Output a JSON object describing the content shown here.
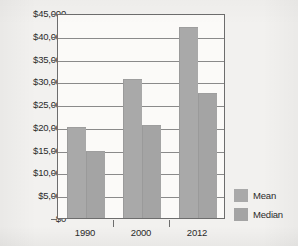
{
  "chart_data": {
    "type": "bar",
    "title": "",
    "xlabel": "",
    "ylabel": "",
    "categories": [
      "1990",
      "2000",
      "2012"
    ],
    "series": [
      {
        "name": "Mean",
        "values": [
          19900,
          30500,
          42000
        ]
      },
      {
        "name": "Median",
        "values": [
          14600,
          20500,
          27500
        ]
      }
    ],
    "ylim": [
      0,
      45000
    ],
    "ytick_values": [
      45000,
      40000,
      35000,
      30000,
      25000,
      20000,
      15000,
      10000,
      5000,
      0
    ],
    "ytick_labels": [
      "$45,000",
      "$40,000",
      "$35,000",
      "$30,000",
      "$25,000",
      "$20,000",
      "$15,000",
      "$10,000",
      "$5,000",
      "$0"
    ],
    "grid": true,
    "legend_position": "right-bottom",
    "colors": {
      "mean": "#a9a9a9",
      "median": "#a4a4a4",
      "axis": "#6d6d6d",
      "grid": "#8a8a8a",
      "background": "#f2f1ef",
      "plot_background": "#fbfaf8",
      "text": "#2b2b2b"
    }
  },
  "legend": {
    "items": [
      {
        "label": "Mean"
      },
      {
        "label": "Median"
      }
    ]
  }
}
